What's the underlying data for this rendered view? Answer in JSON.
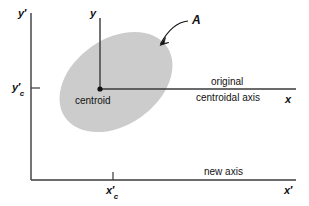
{
  "figure": {
    "background_color": "#ffffff",
    "line_color": "#3a3a3a",
    "area_fill_color": "#cccccc",
    "text_color": "#111111"
  },
  "labels": {
    "y_prime_axis": "y",
    "y_prime_mark": "′",
    "y_prime_c_axis": "y",
    "y_prime_c_mark": "′",
    "y_prime_c_sub": "c",
    "y_axis": "y",
    "x_axis": "x",
    "x_prime_axis": "x",
    "x_prime_mark": "′",
    "x_prime_c_axis": "x",
    "x_prime_c_mark": "′",
    "x_prime_c_sub": "c",
    "area": "A",
    "centroid": "centroid",
    "original": "original",
    "centroidal_axis": "centroidal axis",
    "new_axis": "new axis"
  },
  "geometry": {
    "centroid_point": {
      "x": 100,
      "y": 89
    },
    "ellipse": {
      "cx": 116,
      "cy": 82,
      "rx": 62,
      "ry": 43,
      "rotation_deg": -35
    },
    "y_prime_axis_line": {
      "x": 31,
      "y1": 13,
      "y2": 180
    },
    "x_prime_axis_line": {
      "y": 180,
      "x1": 31,
      "x2": 296
    },
    "y_axis_line": {
      "x": 100,
      "y1": 18,
      "y2": 89
    },
    "x_axis_line": {
      "y": 89,
      "x1": 100,
      "x2": 296
    },
    "y_prime_c_tick": {
      "x": 31,
      "y": 88
    },
    "x_prime_c_tick": {
      "x": 113,
      "y": 180
    },
    "leader_arrow": {
      "from_x": 188,
      "from_y": 21,
      "to_x": 160,
      "to_y": 45
    }
  }
}
